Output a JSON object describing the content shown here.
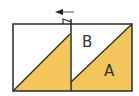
{
  "diagram": {
    "labels": {
      "region_b": "B",
      "region_a": "A"
    },
    "icons": {
      "fold_arrow": "arrow-left-icon",
      "fold_flap": "fold-flap-icon"
    },
    "colors": {
      "fill": "#F2C65A",
      "stroke": "#2a2a2a",
      "background": "#ffffff"
    }
  }
}
